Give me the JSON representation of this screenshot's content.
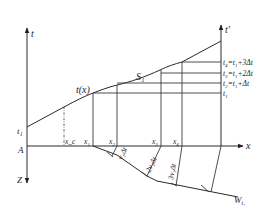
{
  "diagram": {
    "type": "refraction wavefront construction (time-distance)",
    "axes": {
      "left_t": "t",
      "right_t": "t′",
      "x": "x",
      "z": "Z",
      "origin": "A"
    },
    "curve_label": "t(x)",
    "segment_label": "S₁",
    "left_intercept": "t₁",
    "x_points": {
      "xc": "x_c",
      "x1": "x₁",
      "x2": "x₂",
      "x3": "x₃",
      "x4": "x₄"
    },
    "time_levels": [
      "t₄=t₁+3Δt",
      "t₃=t₁+2Δt",
      "t₂=t₁+Δt",
      "t₁"
    ],
    "ray_labels": [
      "v₁Δt",
      "2v₁Δt",
      "3v₁Δt"
    ],
    "boundary_label": "W",
    "boundary_subscript": "t₁"
  },
  "colors": {
    "line": "#2a2a2a",
    "text": "#1e1e1e",
    "background": "#ffffff"
  }
}
